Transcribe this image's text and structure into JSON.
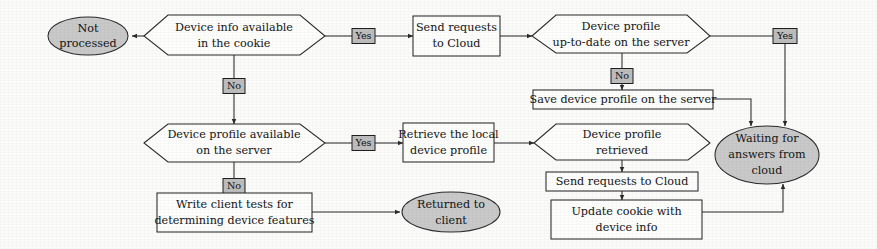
{
  "diagram": {
    "type": "flowchart",
    "colors": {
      "terminator_fill": "#c9c9c9",
      "process_fill": "#fdfdfc",
      "decision_fill": "#fdfdfc",
      "edge_label_fill": "#bdbdbd",
      "stroke": "#2b2b2b",
      "text": "#141414",
      "background": "#fbfbfa"
    },
    "nodes": {
      "not_processed": {
        "shape": "ellipse",
        "line1": "Not",
        "line2": "processed"
      },
      "device_info_cookie": {
        "shape": "decision",
        "line1": "Device info available",
        "line2": "in the cookie"
      },
      "send_requests_cloud": {
        "shape": "process",
        "line1": "Send requests",
        "line2": "to Cloud"
      },
      "profile_up_to_date": {
        "shape": "decision",
        "line1": "Device profile",
        "line2": "up-to-date on the server"
      },
      "save_profile_server": {
        "shape": "process",
        "line1": "Save device profile on the server"
      },
      "waiting_for_answers": {
        "shape": "ellipse",
        "line1": "Waiting for",
        "line2": "answers from",
        "line3": "cloud"
      },
      "profile_available_server": {
        "shape": "decision",
        "line1": "Device profile available",
        "line2": "on the server"
      },
      "retrieve_local_profile": {
        "shape": "process",
        "line1": "Retrieve the local",
        "line2": "device profile"
      },
      "profile_retrieved": {
        "shape": "decision",
        "line1": "Device profile",
        "line2": "retrieved"
      },
      "send_requests_cloud_2": {
        "shape": "process",
        "line1": "Send requests to Cloud"
      },
      "update_cookie": {
        "shape": "process",
        "line1": "Update cookie with",
        "line2": "device info"
      },
      "write_client_tests": {
        "shape": "process",
        "line1": "Write client tests for",
        "line2": "determining device features"
      },
      "returned_to_client": {
        "shape": "ellipse",
        "line1": "Returned to",
        "line2": "client"
      }
    },
    "edge_labels": {
      "cookie_yes": "Yes",
      "cookie_no": "No",
      "uptodate_yes": "Yes",
      "uptodate_no": "No",
      "available_yes": "Yes",
      "available_no": "No"
    }
  }
}
